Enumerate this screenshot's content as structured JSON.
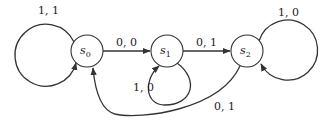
{
  "diagram": {
    "type": "finite-state-machine",
    "states": [
      {
        "id": "s0",
        "label": "s",
        "subscript": "0"
      },
      {
        "id": "s1",
        "label": "s",
        "subscript": "1"
      },
      {
        "id": "s2",
        "label": "s",
        "subscript": "2"
      }
    ],
    "transitions": [
      {
        "from": "s0",
        "to": "s0",
        "label": "1, 1"
      },
      {
        "from": "s0",
        "to": "s1",
        "label": "0, 0"
      },
      {
        "from": "s1",
        "to": "s1",
        "label": "1, 0"
      },
      {
        "from": "s1",
        "to": "s2",
        "label": "0, 1"
      },
      {
        "from": "s2",
        "to": "s2",
        "label": "1, 0"
      },
      {
        "from": "s2",
        "to": "s0",
        "label": "0, 1"
      }
    ]
  }
}
